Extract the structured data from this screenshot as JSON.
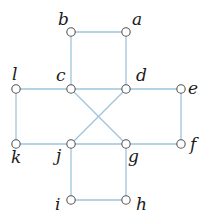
{
  "colors": {
    "edge": "#9ec3dc",
    "node_stroke": "#555555",
    "node_fill": "#ffffff",
    "label": "#1a1a1a"
  },
  "nodes": [
    {
      "id": "a",
      "label": "a",
      "x": 126,
      "y": 32,
      "lx": 132,
      "ly": 25
    },
    {
      "id": "b",
      "label": "b",
      "x": 71,
      "y": 32,
      "lx": 58,
      "ly": 25
    },
    {
      "id": "c",
      "label": "c",
      "x": 71,
      "y": 89,
      "lx": 56,
      "ly": 81
    },
    {
      "id": "d",
      "label": "d",
      "x": 126,
      "y": 89,
      "lx": 136,
      "ly": 81
    },
    {
      "id": "e",
      "label": "e",
      "x": 181,
      "y": 89,
      "lx": 188,
      "ly": 94
    },
    {
      "id": "f",
      "label": "f",
      "x": 181,
      "y": 144,
      "lx": 190,
      "ly": 150
    },
    {
      "id": "g",
      "label": "g",
      "x": 126,
      "y": 144,
      "lx": 128,
      "ly": 162
    },
    {
      "id": "h",
      "label": "h",
      "x": 126,
      "y": 200,
      "lx": 136,
      "ly": 210
    },
    {
      "id": "i",
      "label": "i",
      "x": 71,
      "y": 200,
      "lx": 55,
      "ly": 210
    },
    {
      "id": "j",
      "label": "j",
      "x": 71,
      "y": 144,
      "lx": 56,
      "ly": 161
    },
    {
      "id": "k",
      "label": "k",
      "x": 16,
      "y": 144,
      "lx": 11,
      "ly": 163
    },
    {
      "id": "l",
      "label": "l",
      "x": 16,
      "y": 89,
      "lx": 12,
      "ly": 80
    }
  ],
  "edges": [
    [
      "b",
      "a"
    ],
    [
      "b",
      "c"
    ],
    [
      "a",
      "d"
    ],
    [
      "l",
      "c"
    ],
    [
      "c",
      "d"
    ],
    [
      "d",
      "e"
    ],
    [
      "l",
      "k"
    ],
    [
      "e",
      "f"
    ],
    [
      "k",
      "j"
    ],
    [
      "j",
      "g"
    ],
    [
      "g",
      "f"
    ],
    [
      "c",
      "g"
    ],
    [
      "d",
      "j"
    ],
    [
      "j",
      "i"
    ],
    [
      "g",
      "h"
    ],
    [
      "i",
      "h"
    ]
  ]
}
